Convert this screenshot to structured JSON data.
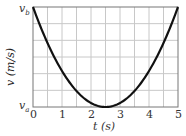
{
  "chart_data": {
    "type": "line",
    "title": "",
    "xlabel": "t (s)",
    "ylabel": "v (m/s)",
    "x_ticks": [
      "0",
      "1",
      "2",
      "3",
      "4",
      "5"
    ],
    "y_ticks": [
      "v_a",
      "v_b"
    ],
    "y_tick_labels": {
      "top": "v",
      "top_sub": "b",
      "bottom": "v",
      "bottom_sub": "a"
    },
    "xlim": [
      0,
      5
    ],
    "ylim": [
      "v_a",
      "v_b"
    ],
    "grid": true,
    "grid_x_step": 0.5,
    "grid_y_divisions": 6,
    "series": [
      {
        "name": "v(t)",
        "shape": "parabola",
        "vertex": {
          "t": 2.5,
          "v": "v_a"
        },
        "x": [
          0,
          0.5,
          1,
          1.5,
          2,
          2.5,
          3,
          3.5,
          4,
          4.5,
          5
        ],
        "values_normalized": [
          1.0,
          0.64,
          0.36,
          0.16,
          0.04,
          0.0,
          0.04,
          0.16,
          0.36,
          0.64,
          1.0
        ]
      }
    ]
  }
}
